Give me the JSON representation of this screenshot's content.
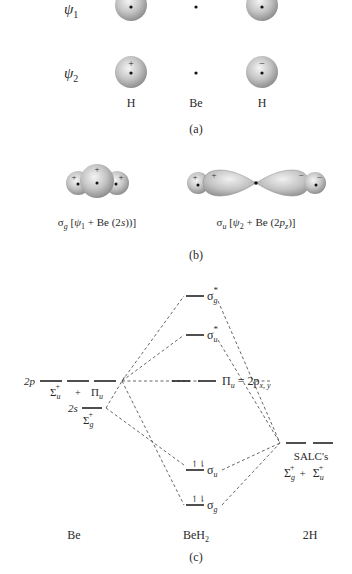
{
  "panel_a": {
    "rows": [
      {
        "label": "ψ",
        "subscript": "1",
        "left_sign": "+",
        "right_sign": "+"
      },
      {
        "label": "ψ",
        "subscript": "2",
        "left_sign": "+",
        "right_sign": "−"
      }
    ],
    "atom_labels": [
      "H",
      "Be",
      "H"
    ],
    "caption": "(a)"
  },
  "panel_b": {
    "sigma_g": {
      "symbol": "σ",
      "sub": "g",
      "text_pre": " [",
      "psi": "ψ",
      "psi_sub": "1",
      "text_post": " + Be (2",
      "orbital": "s",
      "close": "))]",
      "signs": [
        "+",
        "+",
        "+"
      ]
    },
    "sigma_u": {
      "symbol": "σ",
      "sub": "u",
      "text_pre": " [",
      "psi": "ψ",
      "psi_sub": "2",
      "text_post": " + Be (2",
      "orbital": "p",
      "orbital_sub": "z",
      "close": ")]",
      "signs": [
        "+",
        "+",
        "−",
        "−"
      ]
    },
    "caption": "(b)"
  },
  "panel_c": {
    "be_levels": {
      "2p_label": "2p",
      "2p_sym1": "Σ",
      "2p_sym1_sub": "u",
      "2p_sym1_sup": "+",
      "plus": "+",
      "2p_sym2": "Π",
      "2p_sym2_sub": "u",
      "2s_label": "2s",
      "2s_sym": "Σ",
      "2s_sym_sub": "g",
      "2s_sym_sup": "+"
    },
    "mo_levels": [
      {
        "name": "σ",
        "sub": "g",
        "sup": "*",
        "electrons": ""
      },
      {
        "name": "σ",
        "sub": "u",
        "sup": "*",
        "electrons": ""
      },
      {
        "name": "Π",
        "sub": "u",
        "eq": " = 2p",
        "eq_sub": "x, y",
        "electrons": ""
      },
      {
        "name": "σ",
        "sub": "u",
        "electrons": "↿⇂"
      },
      {
        "name": "σ",
        "sub": "g",
        "electrons": "↿⇂"
      }
    ],
    "salc": {
      "label": "SALC's",
      "sym1": "Σ",
      "sym1_sub": "g",
      "sym1_sup": "+",
      "plus": "+",
      "sym2": "Σ",
      "sym2_sub": "u",
      "sym2_sup": "+"
    },
    "column_labels": {
      "left": "Be",
      "middle": "BeH",
      "middle_sub": "2",
      "right": "2H"
    },
    "caption": "(c)"
  }
}
